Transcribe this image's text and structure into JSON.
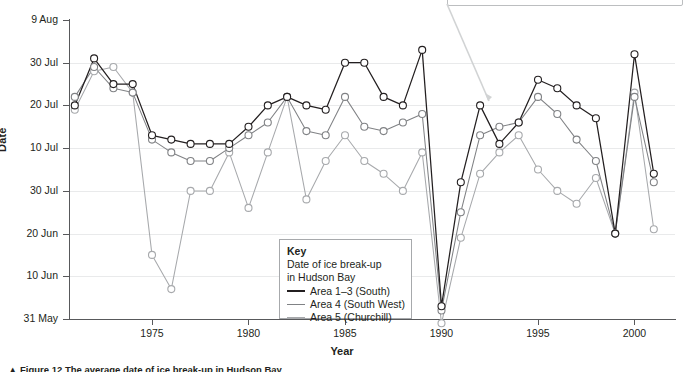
{
  "axes": {
    "y_title": "Date",
    "x_title": "Year",
    "y_ticks": [
      "9 Aug",
      "30 Jul",
      "20 Jul",
      "10 Jul",
      "30 Jul",
      "20 Jun",
      "10 Jun",
      "31 May"
    ],
    "x_ticks": [
      "1975",
      "1980",
      "1985",
      "1990",
      "1995",
      "2000"
    ]
  },
  "legend": {
    "title": "Key",
    "subtitle_line1": "Date of ice break-up",
    "subtitle_line2": "in Hudson Bay",
    "entries": [
      {
        "label": "Area 1–3 (South)",
        "color": "#231f20"
      },
      {
        "label": "Area 4 (South West)",
        "color": "#808285"
      },
      {
        "label": "Area 5 (Churchill)",
        "color": "#a7a9ac"
      }
    ]
  },
  "caption": "▲ Figure 12 The average date of ice break-up in Hudson Bay",
  "chart_data": {
    "type": "line",
    "title": "Date of ice break-up in Hudson Bay",
    "xlabel": "Year",
    "ylabel": "Date",
    "xlim": [
      1970.7,
      2002.1
    ],
    "ylim_labels_top_to_bottom": [
      "9 Aug",
      "30 Jul",
      "20 Jul",
      "10 Jul",
      "30 Jul",
      "20 Jun",
      "10 Jun",
      "31 May"
    ],
    "y_axis_note": "Y axis is a date scale running from 31 May (bottom) to 9 Aug (top); each labelled gridline is 10 days apart. Values below are day-of-year (1 Jun = 152).",
    "grid": "horizontal",
    "legend_position": "inside-bottom-center",
    "x": [
      1971,
      1972,
      1973,
      1974,
      1975,
      1976,
      1977,
      1978,
      1979,
      1980,
      1981,
      1982,
      1983,
      1984,
      1985,
      1986,
      1987,
      1988,
      1989,
      1990,
      1991,
      1992,
      1993,
      1994,
      1995,
      1996,
      1997,
      1998,
      1999,
      2000,
      2001
    ],
    "series": [
      {
        "name": "Area 1–3 (South)",
        "color": "#231f20",
        "values": [
          201,
          212,
          206,
          206,
          194,
          193,
          192,
          192,
          192,
          196,
          201,
          203,
          201,
          200,
          211,
          211,
          203,
          201,
          214,
          154,
          183,
          201,
          192,
          197,
          207,
          205,
          201,
          198,
          171,
          213,
          185
        ]
      },
      {
        "name": "Area 4 (South West)",
        "color": "#808285",
        "values": [
          203,
          210,
          205,
          204,
          193,
          190,
          188,
          188,
          191,
          194,
          197,
          203,
          195,
          194,
          203,
          196,
          195,
          197,
          199,
          153,
          176,
          194,
          196,
          197,
          203,
          199,
          193,
          188,
          171,
          203,
          183
        ]
      },
      {
        "name": "Area 5 (Churchill)",
        "color": "#a7a9ac",
        "values": [
          200,
          209,
          210,
          204,
          166,
          158,
          181,
          181,
          190,
          177,
          190,
          203,
          179,
          188,
          194,
          188,
          185,
          181,
          190,
          150,
          170,
          185,
          190,
          194,
          186,
          181,
          178,
          184,
          171,
          204,
          172
        ]
      }
    ],
    "annotation": {
      "type": "callout-arrow",
      "from_x": 447,
      "from_y": 4,
      "to_x": 489,
      "to_y": 101,
      "color": "#d1d3d4"
    }
  }
}
